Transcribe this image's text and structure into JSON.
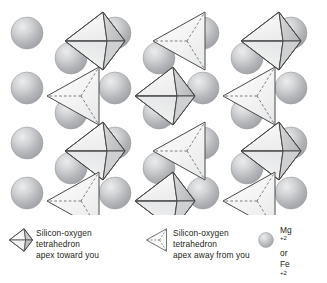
{
  "figure": {
    "background_color": "#ffffff"
  },
  "colors": {
    "sphere_light": "#e9eaec",
    "sphere_mid": "#b6b8bb",
    "sphere_dark": "#9a9c9f",
    "sphere_outline": "#9a9c9f",
    "tetra_face_light": "#fbfbfb",
    "tetra_face_mid": "#e4e5e6",
    "tetra_face_dark": "#c9cacb",
    "tetra_edge": "#4a4a4a",
    "tetra_dash": "#6f6f70",
    "text": "#231f20"
  },
  "lattice": {
    "rows": 4,
    "columns": 7,
    "description": "Alternating gray cation spheres and silicon-oxygen tetrahedra arranged in a repeating lattice",
    "row_patterns": [
      [
        "sphere",
        "tetra-toward",
        "sphere",
        "tetra-away",
        "sphere",
        "tetra-toward",
        "sphere"
      ],
      [
        "sphere",
        "tetra-away",
        "sphere",
        "tetra-toward",
        "sphere",
        "tetra-away",
        "sphere"
      ],
      [
        "sphere",
        "tetra-toward",
        "sphere",
        "tetra-away",
        "sphere",
        "tetra-toward",
        "sphere"
      ],
      [
        "sphere",
        "tetra-away",
        "sphere",
        "tetra-toward",
        "sphere",
        "tetra-away",
        "sphere"
      ]
    ],
    "spheres": [
      {
        "cx": 27,
        "cy": 33,
        "r": 16
      },
      {
        "cx": 71,
        "cy": 58,
        "r": 16
      },
      {
        "cx": 115,
        "cy": 33,
        "r": 16
      },
      {
        "cx": 159,
        "cy": 58,
        "r": 16
      },
      {
        "cx": 203,
        "cy": 33,
        "r": 16
      },
      {
        "cx": 247,
        "cy": 58,
        "r": 16
      },
      {
        "cx": 291,
        "cy": 33,
        "r": 16
      },
      {
        "cx": 27,
        "cy": 88,
        "r": 16
      },
      {
        "cx": 71,
        "cy": 113,
        "r": 16
      },
      {
        "cx": 115,
        "cy": 88,
        "r": 16
      },
      {
        "cx": 159,
        "cy": 113,
        "r": 16
      },
      {
        "cx": 203,
        "cy": 88,
        "r": 16
      },
      {
        "cx": 247,
        "cy": 113,
        "r": 16
      },
      {
        "cx": 291,
        "cy": 88,
        "r": 16
      },
      {
        "cx": 27,
        "cy": 143,
        "r": 16
      },
      {
        "cx": 71,
        "cy": 168,
        "r": 16
      },
      {
        "cx": 115,
        "cy": 143,
        "r": 16
      },
      {
        "cx": 159,
        "cy": 168,
        "r": 16
      },
      {
        "cx": 203,
        "cy": 143,
        "r": 16
      },
      {
        "cx": 247,
        "cy": 168,
        "r": 16
      },
      {
        "cx": 291,
        "cy": 143,
        "r": 16
      },
      {
        "cx": 27,
        "cy": 193,
        "r": 16
      },
      {
        "cx": 115,
        "cy": 193,
        "r": 16
      },
      {
        "cx": 203,
        "cy": 193,
        "r": 16
      },
      {
        "cx": 291,
        "cy": 193,
        "r": 16
      }
    ],
    "tetrahedra": [
      {
        "x": 63,
        "y": 10,
        "type": "toward"
      },
      {
        "x": 151,
        "y": 10,
        "type": "away"
      },
      {
        "x": 239,
        "y": 10,
        "type": "toward"
      },
      {
        "x": 45,
        "y": 65,
        "type": "away"
      },
      {
        "x": 133,
        "y": 65,
        "type": "toward"
      },
      {
        "x": 221,
        "y": 65,
        "type": "away"
      },
      {
        "x": 63,
        "y": 120,
        "type": "toward"
      },
      {
        "x": 151,
        "y": 120,
        "type": "away"
      },
      {
        "x": 239,
        "y": 120,
        "type": "toward"
      },
      {
        "x": 45,
        "y": 170,
        "type": "away"
      },
      {
        "x": 133,
        "y": 170,
        "type": "toward"
      },
      {
        "x": 221,
        "y": 170,
        "type": "away"
      }
    ]
  },
  "legend": {
    "toward": {
      "icon": "tetrahedron-apex-toward-icon",
      "lines": [
        "Silicon-oxygen",
        "tetrahedron",
        "apex toward you"
      ]
    },
    "away": {
      "icon": "tetrahedron-apex-away-icon",
      "lines": [
        "Silicon-oxygen",
        "tetrahedron",
        "apex away from you"
      ]
    },
    "cation": {
      "icon": "cation-sphere-icon",
      "lines": [
        {
          "element": "Mg",
          "charge": "+2"
        },
        {
          "element": "or",
          "charge": ""
        },
        {
          "element": "Fe",
          "charge": "+2"
        }
      ]
    }
  }
}
